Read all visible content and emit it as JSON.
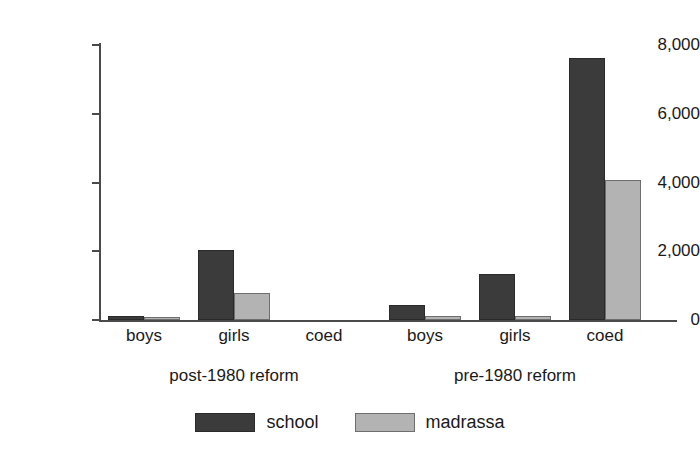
{
  "chart_data": {
    "type": "bar",
    "title": "",
    "subtitle": "",
    "xlabel": "",
    "ylabel": "",
    "ylim": [
      0,
      8000
    ],
    "yticks": [
      0,
      2000,
      4000,
      6000,
      8000
    ],
    "ytick_labels": [
      "0",
      "2,000",
      "4,000",
      "6,000",
      "8,000"
    ],
    "grid": false,
    "legend_position": "bottom-center",
    "categories": [
      "boys",
      "girls",
      "coed",
      "boys",
      "girls",
      "coed"
    ],
    "groups": [
      {
        "label": "post-1980 reform",
        "categories": [
          "boys",
          "girls",
          "coed"
        ]
      },
      {
        "label": "pre-1980 reform",
        "categories": [
          "boys",
          "girls",
          "coed"
        ]
      }
    ],
    "series": [
      {
        "name": "school",
        "color": "#3b3b3b",
        "values": [
          120,
          2030,
          0,
          430,
          1340,
          7620
        ]
      },
      {
        "name": "madrassa",
        "color": "#b3b3b3",
        "values": [
          100,
          800,
          0,
          120,
          110,
          4060
        ]
      }
    ]
  },
  "axis": {
    "ticks": [
      {
        "label": "8,000",
        "value": 8000
      },
      {
        "label": "6,000",
        "value": 6000
      },
      {
        "label": "4,000",
        "value": 4000
      },
      {
        "label": "2,000",
        "value": 2000
      },
      {
        "label": "0",
        "value": 0
      }
    ]
  },
  "categories_row": [
    {
      "label": "boys"
    },
    {
      "label": "girls"
    },
    {
      "label": "coed"
    },
    {
      "label": "boys"
    },
    {
      "label": "girls"
    },
    {
      "label": "coed"
    }
  ],
  "groups_row": [
    {
      "label": "post-1980 reform"
    },
    {
      "label": "pre-1980 reform"
    }
  ],
  "legend": {
    "items": [
      {
        "label": "school",
        "color": "#3b3b3b"
      },
      {
        "label": "madrassa",
        "color": "#b3b3b3"
      }
    ]
  }
}
